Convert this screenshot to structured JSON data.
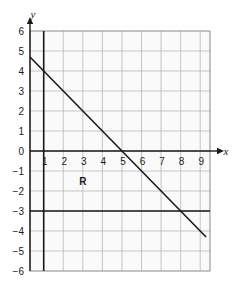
{
  "chart_data": {
    "type": "line",
    "title": "",
    "xlabel": "x",
    "ylabel": "y",
    "xlim": [
      0.3,
      9.5
    ],
    "ylim": [
      -6,
      6
    ],
    "grid": true,
    "legend": null,
    "x_ticks": [
      "1",
      "2",
      "3",
      "4",
      "5",
      "6",
      "7",
      "8",
      "9"
    ],
    "x_tick_values": [
      1,
      2,
      3,
      4,
      5,
      6,
      7,
      8,
      9
    ],
    "y_ticks": [
      "6",
      "5",
      "4",
      "3",
      "2",
      "1",
      "0",
      "−1",
      "−2",
      "−3",
      "−4",
      "−5",
      "−6"
    ],
    "y_tick_values": [
      6,
      5,
      4,
      3,
      2,
      1,
      0,
      -1,
      -2,
      -3,
      -4,
      -5,
      -6
    ],
    "series": [
      {
        "name": "diagonal-boundary-line",
        "equation": "y = -x + 5",
        "points": [
          [
            0.3,
            4.7
          ],
          [
            9.3,
            -4.3
          ]
        ],
        "slope": -1,
        "intercept": 5,
        "style": "solid",
        "color": "#1a1a1a",
        "width": 1.6
      },
      {
        "name": "vertical-boundary-line",
        "equation": "x = 1",
        "points": [
          [
            1,
            6
          ],
          [
            1,
            -6
          ]
        ],
        "style": "solid",
        "color": "#1a1a1a",
        "width": 1.6
      },
      {
        "name": "horizontal-boundary-line",
        "equation": "y = -3",
        "points": [
          [
            0.3,
            -3
          ],
          [
            9.5,
            -3
          ]
        ],
        "style": "solid",
        "color": "#1a1a1a",
        "width": 1.6
      }
    ],
    "annotations": [
      {
        "text": "R",
        "x": 3,
        "y": -1.5,
        "name": "region-label-r"
      }
    ],
    "colors": {
      "grid": "#b8b8b8",
      "axis": "#1a1a1a",
      "background": "#fafafa",
      "line": "#1a1a1a"
    }
  }
}
